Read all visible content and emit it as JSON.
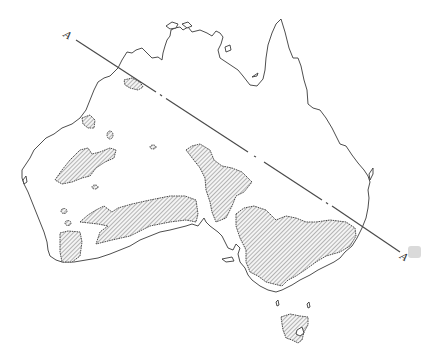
{
  "figure": {
    "type": "map",
    "section_line": {
      "start_label": "A",
      "end_label": "A",
      "style": "dash-dot"
    },
    "colors": {
      "outline": "#3a3a3a",
      "hatch": "#555555",
      "background": "#ffffff"
    }
  }
}
